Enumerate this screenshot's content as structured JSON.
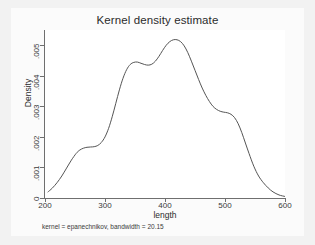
{
  "chart_data": {
    "type": "line",
    "title": "Kernel density estimate",
    "xlabel": "length",
    "ylabel": "Density",
    "note": "kernel = epanechnikov, bandwidth = 20.15",
    "xlim": [
      200,
      600
    ],
    "ylim": [
      0,
      0.0055
    ],
    "xticks": [
      200,
      300,
      400,
      500,
      600
    ],
    "xtick_labels": [
      "200",
      "300",
      "400",
      "500",
      "600"
    ],
    "yticks": [
      0,
      0.001,
      0.002,
      0.003,
      0.004,
      0.005
    ],
    "ytick_labels": [
      "0",
      ".001",
      ".002",
      ".003",
      ".004",
      ".005"
    ],
    "grid": false,
    "legend": false,
    "series": [
      {
        "name": "density",
        "color": "#555555",
        "x": [
          205,
          212,
          220,
          228,
          236,
          244,
          252,
          258,
          264,
          270,
          276,
          282,
          288,
          294,
          300,
          306,
          312,
          318,
          324,
          330,
          336,
          342,
          348,
          354,
          360,
          366,
          372,
          378,
          384,
          390,
          396,
          402,
          408,
          414,
          420,
          426,
          432,
          438,
          444,
          450,
          456,
          462,
          468,
          474,
          480,
          486,
          492,
          498,
          504,
          510,
          516,
          522,
          528,
          534,
          540,
          548,
          556,
          564,
          572,
          580,
          590,
          600
        ],
        "y": [
          0.0002,
          0.00032,
          0.0005,
          0.00072,
          0.00098,
          0.00124,
          0.00146,
          0.00157,
          0.00163,
          0.00166,
          0.00167,
          0.00168,
          0.00172,
          0.00182,
          0.002,
          0.00228,
          0.00266,
          0.0031,
          0.00354,
          0.00392,
          0.0042,
          0.00437,
          0.00444,
          0.00445,
          0.00441,
          0.00437,
          0.00435,
          0.00438,
          0.00448,
          0.00464,
          0.00483,
          0.005,
          0.00512,
          0.00518,
          0.00518,
          0.00512,
          0.00498,
          0.00476,
          0.00448,
          0.00418,
          0.00388,
          0.0036,
          0.00336,
          0.00316,
          0.003,
          0.0029,
          0.00284,
          0.00281,
          0.00279,
          0.00274,
          0.00263,
          0.00243,
          0.00214,
          0.0018,
          0.00146,
          0.00104,
          0.00072,
          0.0005,
          0.00033,
          0.0002,
          0.0001,
          5e-05
        ]
      }
    ]
  }
}
